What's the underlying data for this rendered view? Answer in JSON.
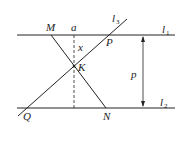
{
  "diagram": {
    "lines": {
      "l1": {
        "label": "l",
        "sub": "1"
      },
      "l2": {
        "label": "l",
        "sub": "2"
      },
      "l3": {
        "label": "l",
        "sub": "3"
      }
    },
    "points": {
      "M": "M",
      "N": "N",
      "P": "P",
      "Q": "Q",
      "K": "K"
    },
    "labels": {
      "a": "a",
      "x": "x",
      "p": "p"
    },
    "colors": {
      "stroke": "#222222",
      "background": "#ffffff"
    }
  }
}
